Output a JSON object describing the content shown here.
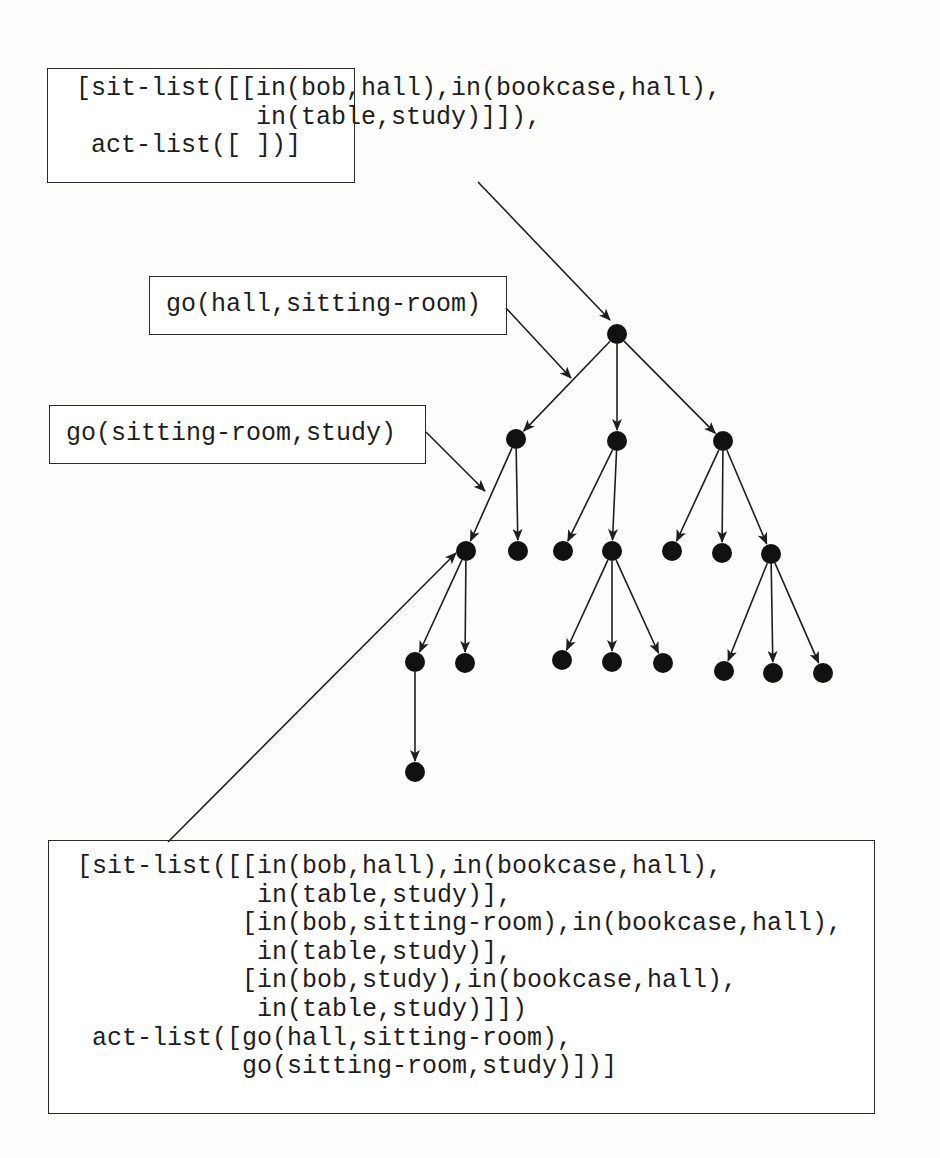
{
  "figure": {
    "type": "search-tree",
    "boxes": {
      "initial_state": {
        "lines": [
          "[sit-list([[in(bob,hall),in(bookcase,hall),",
          "            in(table,study)]]),",
          " act-list([ ])]"
        ]
      },
      "action_1": {
        "lines": [
          "go(hall,sitting-room)"
        ]
      },
      "action_2": {
        "lines": [
          "go(sitting-room,study)"
        ]
      },
      "goal_state": {
        "lines": [
          "[sit-list([[in(bob,hall),in(bookcase,hall),",
          "            in(table,study)],",
          "           [in(bob,sitting-room),in(bookcase,hall),",
          "            in(table,study)],",
          "           [in(bob,study),in(bookcase,hall),",
          "            in(table,study)]])",
          " act-list([go(hall,sitting-room),",
          "           go(sitting-room,study)])]"
        ]
      }
    },
    "colors": {
      "ink": "#1e1e1e",
      "node_fill": "#111111",
      "background": "#fdfdfc"
    },
    "nodes": [
      {
        "id": "root",
        "x": 617,
        "y": 334
      },
      {
        "id": "a",
        "x": 516,
        "y": 439
      },
      {
        "id": "b",
        "x": 617,
        "y": 441
      },
      {
        "id": "c",
        "x": 723,
        "y": 441
      },
      {
        "id": "a1",
        "x": 466,
        "y": 551
      },
      {
        "id": "a2",
        "x": 518,
        "y": 551
      },
      {
        "id": "b1",
        "x": 563,
        "y": 551
      },
      {
        "id": "b2",
        "x": 612,
        "y": 551
      },
      {
        "id": "c1",
        "x": 672,
        "y": 551
      },
      {
        "id": "c2",
        "x": 722,
        "y": 553
      },
      {
        "id": "c3",
        "x": 771,
        "y": 554
      },
      {
        "id": "a1a",
        "x": 415,
        "y": 662
      },
      {
        "id": "a1b",
        "x": 465,
        "y": 663
      },
      {
        "id": "b2a",
        "x": 562,
        "y": 660
      },
      {
        "id": "b2b",
        "x": 612,
        "y": 662
      },
      {
        "id": "b2c",
        "x": 663,
        "y": 663
      },
      {
        "id": "c3a",
        "x": 724,
        "y": 671
      },
      {
        "id": "c3b",
        "x": 773,
        "y": 673
      },
      {
        "id": "c3c",
        "x": 823,
        "y": 673
      },
      {
        "id": "a1a1",
        "x": 415,
        "y": 772
      }
    ],
    "edges": [
      [
        "root",
        "a"
      ],
      [
        "root",
        "b"
      ],
      [
        "root",
        "c"
      ],
      [
        "a",
        "a1"
      ],
      [
        "a",
        "a2"
      ],
      [
        "b",
        "b1"
      ],
      [
        "b",
        "b2"
      ],
      [
        "c",
        "c1"
      ],
      [
        "c",
        "c2"
      ],
      [
        "c",
        "c3"
      ],
      [
        "a1",
        "a1a"
      ],
      [
        "a1",
        "a1b"
      ],
      [
        "b2",
        "b2a"
      ],
      [
        "b2",
        "b2b"
      ],
      [
        "b2",
        "b2c"
      ],
      [
        "c3",
        "c3a"
      ],
      [
        "c3",
        "c3b"
      ],
      [
        "c3",
        "c3c"
      ],
      [
        "a1a",
        "a1a1"
      ]
    ],
    "pointers": [
      {
        "from": [
          478,
          182
        ],
        "to": [
          610,
          320
        ],
        "label_ref": "initial_state"
      },
      {
        "from": [
          506,
          308
        ],
        "to": [
          571,
          378
        ],
        "label_ref": "action_1"
      },
      {
        "from": [
          426,
          432
        ],
        "to": [
          485,
          491
        ],
        "label_ref": "action_2"
      },
      {
        "from": [
          168,
          842
        ],
        "to": [
          456,
          553
        ],
        "label_ref": "goal_state"
      }
    ],
    "node_radius": 10
  }
}
